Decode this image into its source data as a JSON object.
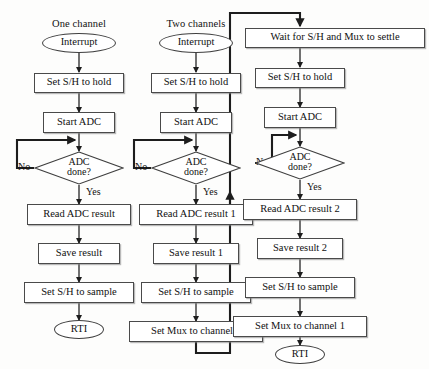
{
  "figure": {
    "type": "flowchart",
    "background_color": "#fdfdfc",
    "line_color": "#222222",
    "box_fill": "#ffffff"
  },
  "columns": [
    {
      "id": "one-channel",
      "title": "One channel",
      "nodes": [
        {
          "id": "c1-interrupt",
          "shape": "terminator",
          "label": "Interrupt"
        },
        {
          "id": "c1-hold",
          "shape": "process",
          "label": "Set S/H to hold"
        },
        {
          "id": "c1-start",
          "shape": "process",
          "label": "Start ADC"
        },
        {
          "id": "c1-done",
          "shape": "decision",
          "label": "ADC done?",
          "line1": "ADC",
          "line2": "done?"
        },
        {
          "id": "c1-read",
          "shape": "process",
          "label": "Read ADC result"
        },
        {
          "id": "c1-save",
          "shape": "process",
          "label": "Save result"
        },
        {
          "id": "c1-sample",
          "shape": "process",
          "label": "Set S/H to sample"
        },
        {
          "id": "c1-rti",
          "shape": "terminator",
          "label": "RTI"
        }
      ],
      "edge_labels": {
        "no": "No",
        "yes": "Yes"
      }
    },
    {
      "id": "two-channels",
      "title": "Two channels",
      "nodes": [
        {
          "id": "c2-interrupt",
          "shape": "terminator",
          "label": "Interrupt"
        },
        {
          "id": "c2-hold",
          "shape": "process",
          "label": "Set S/H to hold"
        },
        {
          "id": "c2-start",
          "shape": "process",
          "label": "Start ADC"
        },
        {
          "id": "c2-done",
          "shape": "decision",
          "label": "ADC done?",
          "line1": "ADC",
          "line2": "done?"
        },
        {
          "id": "c2-read",
          "shape": "process",
          "label": "Read ADC result 1"
        },
        {
          "id": "c2-save",
          "shape": "process",
          "label": "Save result 1"
        },
        {
          "id": "c2-sample",
          "shape": "process",
          "label": "Set S/H to sample"
        },
        {
          "id": "c2-mux",
          "shape": "process",
          "label": "Set Mux to channel 2"
        }
      ],
      "edge_labels": {
        "no": "No",
        "yes": "Yes"
      }
    },
    {
      "id": "two-channels-second-half",
      "title": "",
      "nodes": [
        {
          "id": "c3-wait",
          "shape": "process",
          "label": "Wait for S/H and Mux to settle"
        },
        {
          "id": "c3-hold",
          "shape": "process",
          "label": "Set S/H to hold"
        },
        {
          "id": "c3-start",
          "shape": "process",
          "label": "Start ADC"
        },
        {
          "id": "c3-done",
          "shape": "decision",
          "label": "ADC done?",
          "line1": "ADC",
          "line2": "done?"
        },
        {
          "id": "c3-read",
          "shape": "process",
          "label": "Read ADC result 2"
        },
        {
          "id": "c3-save",
          "shape": "process",
          "label": "Save result 2"
        },
        {
          "id": "c3-sample",
          "shape": "process",
          "label": "Set S/H to sample"
        },
        {
          "id": "c3-mux",
          "shape": "process",
          "label": "Set Mux to channel 1"
        },
        {
          "id": "c3-rti",
          "shape": "terminator",
          "label": "RTI"
        }
      ],
      "edge_labels": {
        "no": "No",
        "yes": "Yes"
      }
    }
  ]
}
